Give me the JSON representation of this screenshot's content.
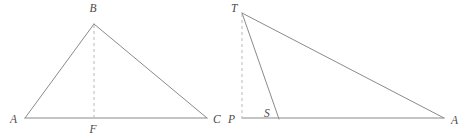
{
  "figure": {
    "background_color": "#ffffff",
    "stroke_color": "#8a8a8a",
    "dashed_color": "#b9b9b9",
    "label_color": "#4a4a4a",
    "stroke_width": 1,
    "figures": [
      {
        "id": "left-triangle",
        "name": "triangle-ABC-with-altitude-BF",
        "vertices": [
          {
            "label": "A",
            "x": 25,
            "y": 118,
            "label_x": 10,
            "label_y": 123
          },
          {
            "label": "B",
            "x": 94,
            "y": 24,
            "label_x": 89,
            "label_y": 12
          },
          {
            "label": "C",
            "x": 207,
            "y": 118,
            "label_x": 213,
            "label_y": 123
          },
          {
            "label": "F",
            "x": 94,
            "y": 118,
            "label_x": 89,
            "label_y": 133
          }
        ],
        "solid_segments": [
          {
            "name": "side-AB",
            "from": "A",
            "to": "B"
          },
          {
            "name": "side-BC",
            "from": "B",
            "to": "C"
          },
          {
            "name": "base-AC",
            "from": "A",
            "to": "C"
          }
        ],
        "dashed_segments": [
          {
            "name": "altitude-BF",
            "from": "B",
            "to": "F"
          }
        ]
      },
      {
        "id": "right-triangle",
        "name": "triangle-TPA-with-cevian-TS",
        "vertices": [
          {
            "label": "T",
            "x": 242,
            "y": 13,
            "label_x": 231,
            "label_y": 12
          },
          {
            "label": "P",
            "x": 242,
            "y": 118,
            "label_x": 228,
            "label_y": 123
          },
          {
            "label": "S",
            "x": 279,
            "y": 118,
            "label_x": 264,
            "label_y": 117
          },
          {
            "label": "A",
            "x": 444,
            "y": 118,
            "label_x": 451,
            "label_y": 124
          }
        ],
        "solid_segments": [
          {
            "name": "hypotenuse-TA",
            "from": "T",
            "to": "A"
          },
          {
            "name": "cevian-TS",
            "from": "T",
            "to": "S"
          },
          {
            "name": "base-PA",
            "from": "P",
            "to": "A"
          }
        ],
        "dashed_segments": [
          {
            "name": "vertical-TP",
            "from": "T",
            "to": "P"
          }
        ]
      }
    ]
  }
}
